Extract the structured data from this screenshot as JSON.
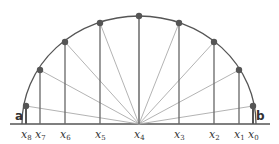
{
  "diagram": {
    "endpoints": {
      "left": "a",
      "right": "b"
    },
    "nodes": [
      {
        "label": "x",
        "sub": "0",
        "x": 253,
        "y": 106
      },
      {
        "label": "x",
        "sub": "1",
        "x": 239,
        "y": 70
      },
      {
        "label": "x",
        "sub": "2",
        "x": 214,
        "y": 42
      },
      {
        "label": "x",
        "sub": "3",
        "x": 179,
        "y": 23
      },
      {
        "label": "x",
        "sub": "4",
        "x": 139,
        "y": 16
      },
      {
        "label": "x",
        "sub": "5",
        "x": 100,
        "y": 23
      },
      {
        "label": "x",
        "sub": "6",
        "x": 65,
        "y": 42
      },
      {
        "label": "x",
        "sub": "7",
        "x": 40,
        "y": 70
      },
      {
        "label": "x",
        "sub": "8",
        "x": 26,
        "y": 106
      }
    ],
    "colors": {
      "arc": "#555555",
      "vertical": "#666666",
      "ray": "#aaaaaa",
      "dot": "#555555",
      "baseline": "#555555"
    }
  }
}
